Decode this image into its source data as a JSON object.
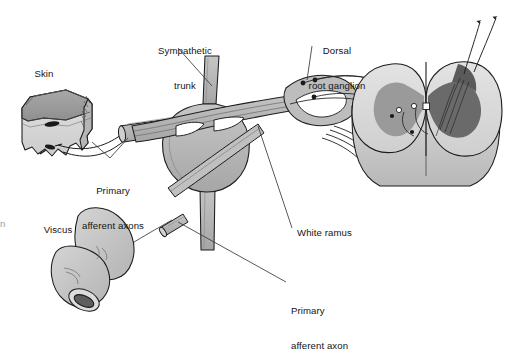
{
  "figure": {
    "background_color": "#ffffff"
  },
  "palette": {
    "outline": "#1c1c1c",
    "nerve_fill": "#b3b3b3",
    "nerve_fill_light": "#c8c8c8",
    "cord_white_matter": "#d2d2d2",
    "cord_white_matter_shadow": "#bdbdbd",
    "gray_matter_left": "#9a9a9a",
    "gray_matter_right": "#6a6a6a",
    "skin_epidermis": "#9e9e9e",
    "skin_dermis": "#d8d8d8",
    "viscus_fill": "#c4c4c4",
    "viscus_lumen": "#5e5e5e",
    "leader_line": "#3a3a3a",
    "label_text": "#141414"
  },
  "labels": [
    {
      "id": "skin",
      "text": "Skin",
      "x": 44,
      "y": 68,
      "align": "center",
      "lines": [
        "Skin"
      ]
    },
    {
      "id": "sympathetic-trunk",
      "text": "Sympathetic\ntrunk",
      "x": 185,
      "y": 22,
      "align": "center",
      "lines": [
        "Sympathetic",
        "trunk"
      ]
    },
    {
      "id": "dorsal-root-ganglion",
      "text": "Dorsal\nroot ganglion",
      "x": 337,
      "y": 22,
      "align": "center",
      "lines": [
        "Dorsal",
        "root ganglion"
      ]
    },
    {
      "id": "primary-afferent-axons",
      "text": "Primary\nafferent axons",
      "x": 113,
      "y": 162,
      "align": "center",
      "lines": [
        "Primary",
        "afferent axons"
      ]
    },
    {
      "id": "viscus",
      "text": "Viscus",
      "x": 58,
      "y": 224,
      "align": "center",
      "lines": [
        "Viscus"
      ]
    },
    {
      "id": "white-ramus",
      "text": "White ramus",
      "x": 297,
      "y": 227,
      "align": "left",
      "lines": [
        "White ramus"
      ]
    },
    {
      "id": "primary-afferent-axon",
      "text": "Primary\nafferent axon",
      "x": 291,
      "y": 282,
      "align": "left",
      "lines": [
        "Primary",
        "afferent axon"
      ]
    }
  ],
  "clipped_caption_fragment": {
    "text": "n",
    "x": 0,
    "y": 218
  },
  "anatomy": {
    "skin_block": {
      "name": "skin",
      "receptor_endings": 2
    },
    "viscus": {
      "name": "viscus",
      "cut_end_lumen": true
    },
    "sympathetic_trunk": {
      "name": "sympathetic trunk"
    },
    "sympathetic_ganglion": {
      "name": "sympathetic chain ganglion"
    },
    "white_ramus": {
      "name": "white ramus communicans"
    },
    "dorsal_root_ganglion": {
      "name": "dorsal root ganglion",
      "cell_bodies": 3
    },
    "spinal_cord": {
      "name": "spinal cord segment",
      "gray_matter_halves": 2,
      "central_canal": true
    },
    "ascending_tracts": {
      "name": "ascending projection arrows",
      "count": 2
    }
  }
}
